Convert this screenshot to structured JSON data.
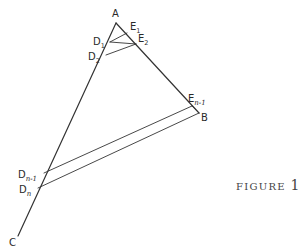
{
  "figure": {
    "caption_word": "FIGURE",
    "caption_number": "1"
  },
  "points": {
    "A": {
      "label": "A",
      "x": 116,
      "y": 23
    },
    "B": {
      "label": "B",
      "x": 199,
      "y": 113
    },
    "C": {
      "label": "C",
      "x": 18,
      "y": 236
    },
    "D1": {
      "label": "D",
      "sub": "1",
      "x": 110,
      "y": 42
    },
    "D2": {
      "label": "D",
      "sub": "2",
      "x": 106,
      "y": 55
    },
    "Dn1": {
      "label": "D",
      "sub": "n-1",
      "x": 44,
      "y": 173
    },
    "Dn": {
      "label": "D",
      "sub": "n",
      "x": 38,
      "y": 188
    },
    "E1": {
      "label": "E",
      "sub": "1",
      "x": 127,
      "y": 33
    },
    "E2": {
      "label": "E",
      "sub": "2",
      "x": 136,
      "y": 44
    },
    "En1": {
      "label": "E",
      "sub": "n-1",
      "x": 192,
      "y": 106
    }
  },
  "segments": [
    [
      "A",
      "C"
    ],
    [
      "A",
      "B"
    ],
    [
      "D1",
      "E1"
    ],
    [
      "D1",
      "E2"
    ],
    [
      "D2",
      "E2"
    ],
    [
      "Dn1",
      "En1"
    ],
    [
      "Dn",
      "B"
    ],
    [
      "En1",
      "B"
    ]
  ],
  "colors": {
    "stroke": "#333333",
    "text": "#2a2a2a"
  }
}
